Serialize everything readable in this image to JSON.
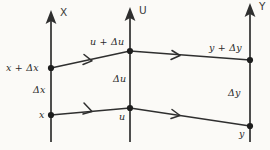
{
  "diagram": {
    "background_color": "#fbfaf7",
    "line_color": "#2f2f2f",
    "text_color": "#2b2b2b",
    "axes": [
      {
        "id": "x-axis",
        "label": "X"
      },
      {
        "id": "u-axis",
        "label": "U"
      },
      {
        "id": "y-axis",
        "label": "Y"
      }
    ],
    "labels": {
      "x_upper": "x + Δx",
      "x_delta": "Δx",
      "x_lower": "x",
      "u_upper": "u + Δu",
      "u_delta": "Δu",
      "u_lower": "u",
      "y_upper": "y + Δy",
      "y_delta": "Δy",
      "y_lower": "y"
    },
    "nodes": [
      {
        "id": "node-x-upper",
        "axis": "X",
        "row": "upper"
      },
      {
        "id": "node-x-lower",
        "axis": "X",
        "row": "lower"
      },
      {
        "id": "node-u-upper",
        "axis": "U",
        "row": "upper"
      },
      {
        "id": "node-u-lower",
        "axis": "U",
        "row": "lower"
      },
      {
        "id": "node-y-upper",
        "axis": "Y",
        "row": "upper"
      },
      {
        "id": "node-y-lower",
        "axis": "Y",
        "row": "lower"
      }
    ],
    "arrows": [
      {
        "id": "arrow-x-upper-to-u-upper",
        "from": "node-x-upper",
        "to": "node-u-upper"
      },
      {
        "id": "arrow-u-upper-to-y-upper",
        "from": "node-u-upper",
        "to": "node-y-upper"
      },
      {
        "id": "arrow-x-lower-to-u-lower",
        "from": "node-x-lower",
        "to": "node-u-lower"
      },
      {
        "id": "arrow-u-lower-to-y-lower",
        "from": "node-u-lower",
        "to": "node-y-lower"
      }
    ]
  }
}
